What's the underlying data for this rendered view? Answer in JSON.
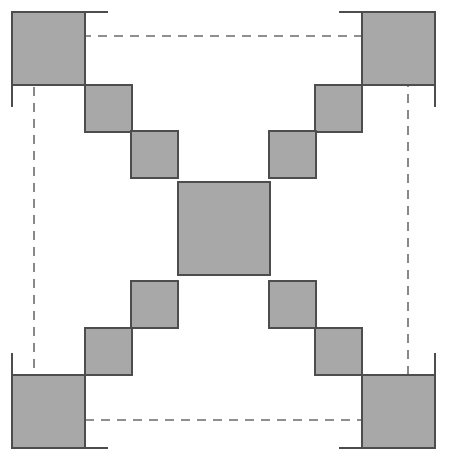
{
  "figure": {
    "width": 450,
    "height": 468,
    "background_color": "#ffffff"
  },
  "style": {
    "fill_color": "#a8a8a8",
    "stroke_color": "#4d4d4d",
    "stroke_width": 2,
    "dash_color": "#6b6b6b",
    "dash_width": 1.6,
    "dash_pattern": "9,7",
    "tick_color": "#4d4d4d",
    "tick_width": 2
  },
  "chart_data": {
    "type": "diagram",
    "grid_pitch": 46.5,
    "squares": [
      {
        "name": "corner-square-top-left",
        "x": 12,
        "y": 12,
        "w": 73,
        "h": 73
      },
      {
        "name": "corner-square-top-right",
        "x": 362,
        "y": 12,
        "w": 73,
        "h": 73
      },
      {
        "name": "corner-square-bottom-left",
        "x": 12,
        "y": 375,
        "w": 73,
        "h": 73
      },
      {
        "name": "corner-square-bottom-right",
        "x": 362,
        "y": 375,
        "w": 73,
        "h": 73
      },
      {
        "name": "step-square-upper-left-outer",
        "x": 85,
        "y": 85,
        "w": 47,
        "h": 47
      },
      {
        "name": "step-square-upper-left-inner",
        "x": 131,
        "y": 131,
        "w": 47,
        "h": 47
      },
      {
        "name": "step-square-upper-right-outer",
        "x": 315,
        "y": 85,
        "w": 47,
        "h": 47
      },
      {
        "name": "step-square-upper-right-inner",
        "x": 269,
        "y": 131,
        "w": 47,
        "h": 47
      },
      {
        "name": "step-square-lower-left-outer",
        "x": 85,
        "y": 328,
        "w": 47,
        "h": 47
      },
      {
        "name": "step-square-lower-left-inner",
        "x": 131,
        "y": 281,
        "w": 47,
        "h": 47
      },
      {
        "name": "step-square-lower-right-outer",
        "x": 315,
        "y": 328,
        "w": 47,
        "h": 47
      },
      {
        "name": "step-square-lower-right-inner",
        "x": 269,
        "y": 281,
        "w": 47,
        "h": 47
      },
      {
        "name": "center-square",
        "x": 178,
        "y": 182,
        "w": 92,
        "h": 93
      }
    ],
    "dashed_rectangle": {
      "x": 34,
      "y": 36,
      "w": 374,
      "h": 384
    },
    "tick_lines": [
      {
        "name": "tick-top-left-horizontal",
        "x1": 12,
        "y1": 12,
        "x2": 108,
        "y2": 12
      },
      {
        "name": "tick-top-left-vertical",
        "x1": 12,
        "y1": 12,
        "x2": 12,
        "y2": 107
      },
      {
        "name": "tick-top-right-horizontal",
        "x1": 339,
        "y1": 12,
        "x2": 435,
        "y2": 12
      },
      {
        "name": "tick-top-right-vertical",
        "x1": 435,
        "y1": 12,
        "x2": 435,
        "y2": 107
      },
      {
        "name": "tick-bottom-left-horizontal",
        "x1": 12,
        "y1": 448,
        "x2": 108,
        "y2": 448
      },
      {
        "name": "tick-bottom-left-vertical",
        "x1": 12,
        "y1": 353,
        "x2": 12,
        "y2": 448
      },
      {
        "name": "tick-bottom-right-horizontal",
        "x1": 339,
        "y1": 448,
        "x2": 435,
        "y2": 448
      },
      {
        "name": "tick-bottom-right-vertical",
        "x1": 435,
        "y1": 353,
        "x2": 435,
        "y2": 448
      }
    ],
    "counts": {
      "corner_squares": 4,
      "step_squares": 8,
      "center_squares": 1,
      "total_squares": 13
    }
  }
}
